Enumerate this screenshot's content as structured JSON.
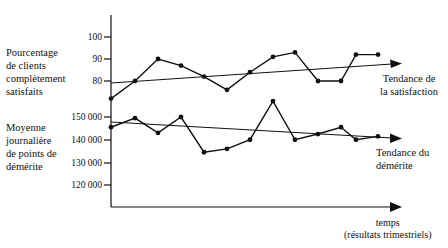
{
  "chart_data": {
    "type": "line",
    "title": "",
    "xlabel": "temps (résultats trimestriels)",
    "x": [
      1,
      2,
      3,
      4,
      5,
      6,
      7,
      8,
      9,
      10,
      11,
      12,
      13
    ],
    "panels": [
      {
        "ylabel": "Pourcentage de clients complètement satisfaits",
        "yticks": [
          80,
          90,
          100
        ],
        "ylim": [
          70,
          103
        ],
        "series": [
          {
            "name": "Satisfaction",
            "values": [
              72,
              80,
              90,
              87,
              82,
              76,
              84,
              91,
              93,
              80,
              80,
              92,
              92
            ]
          },
          {
            "name": "Tendance de la satisfaction",
            "type": "trend",
            "values": [
              79.5,
              88
            ]
          }
        ]
      },
      {
        "ylabel": "Moyenne journalière de points de démérite",
        "yticks": [
          120000,
          130000,
          140000,
          150000
        ],
        "ylim": [
          110000,
          160000
        ],
        "series": [
          {
            "name": "Points de démérite",
            "values": [
              145500,
              149500,
              143000,
              150000,
              134500,
              136000,
              140000,
              157000,
              140000,
              142500,
              145500,
              140000,
              141500
            ]
          },
          {
            "name": "Tendance du démérite",
            "type": "trend",
            "values": [
              147500,
              141000
            ]
          }
        ]
      }
    ],
    "grid": false,
    "legend": "inline annotations at right"
  },
  "labels": {
    "left_top": "Pourcentage\nde clients\ncomplètement\nsatisfaits",
    "left_bottom": "Moyenne\njournalière\nde points de\ndémérite",
    "trend_sat": "Tendance de\nla satisfaction",
    "trend_dem": "Tendance du\ndémérite",
    "x_axis": "temps\n(résultats trimestriels)"
  },
  "ticks": {
    "t100": "100",
    "t90": "90",
    "t80": "80",
    "t150k": "150 000",
    "t140k": "140 000",
    "t130k": "130 000",
    "t120k": "120 000"
  },
  "colors": {
    "ink": "#111111",
    "background": "#ffffff"
  }
}
